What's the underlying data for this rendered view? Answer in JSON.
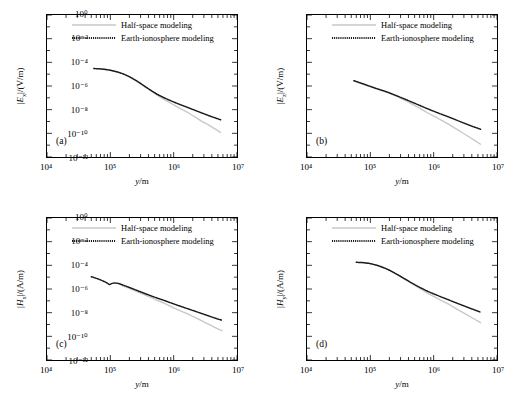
{
  "figure": {
    "panels": [
      "a",
      "b",
      "c",
      "d"
    ]
  },
  "axes": {
    "xlabel": "y/m",
    "xticks": [
      "10⁴",
      "10⁵",
      "10⁶",
      "10⁷"
    ],
    "xlim": [
      10000,
      10000000
    ],
    "yticks": [
      "10⁰",
      "10⁻²",
      "10⁻⁴",
      "10⁻⁶",
      "10⁻⁸",
      "10⁻¹⁰",
      "10⁻¹²"
    ],
    "ylim": [
      1e-12,
      1
    ],
    "grid": false,
    "xscale": "log",
    "yscale": "log"
  },
  "legend": {
    "position": "upper-center",
    "entries": [
      {
        "label": "Half-space modeling",
        "style": "solid",
        "color": "#c8c8c8"
      },
      {
        "label": "Earth-ionosphere modeling",
        "style": "dotted",
        "color": "#1a1a1a"
      }
    ]
  },
  "chart_data": [
    {
      "type": "line",
      "panel": "(a)",
      "title": "",
      "xlabel": "y/m",
      "ylabel": "|Eₓ|/(V/m)",
      "ylabel_base": "E",
      "ylabel_sub": "x",
      "ylabel_unit": "(V/m)",
      "xlim": [
        10000,
        10000000
      ],
      "ylim": [
        1e-12,
        1
      ],
      "series": [
        {
          "name": "Half-space modeling",
          "style": "solid",
          "color": "#c8c8c8",
          "x": [
            55000,
            80000,
            120000,
            180000,
            260000,
            380000,
            550000,
            800000,
            1200000,
            1800000,
            2600000,
            3800000,
            5500000
          ],
          "y": [
            3e-05,
            2.6e-05,
            1.7e-05,
            8e-06,
            2.6e-06,
            6.5e-07,
            1.7e-07,
            5e-08,
            1.5e-08,
            4.5e-09,
            1.3e-09,
            4e-10,
            1.2e-10
          ]
        },
        {
          "name": "Earth-ionosphere modeling",
          "style": "dotted",
          "color": "#1a1a1a",
          "x": [
            55000,
            80000,
            120000,
            180000,
            260000,
            380000,
            550000,
            800000,
            1200000,
            1800000,
            2600000,
            3800000,
            5500000
          ],
          "y": [
            3e-05,
            2.6e-05,
            1.7e-05,
            8e-06,
            2.7e-06,
            7e-07,
            2e-07,
            7.5e-08,
            3e-08,
            1.3e-08,
            6e-09,
            2.8e-09,
            1.4e-09
          ]
        }
      ]
    },
    {
      "type": "line",
      "panel": "(b)",
      "title": "",
      "xlabel": "y/m",
      "ylabel": "|Eᵣ|/(V/m)",
      "ylabel_base": "E",
      "ylabel_sub": "z",
      "ylabel_unit": "(V/m)",
      "xlim": [
        10000,
        10000000
      ],
      "ylim": [
        1e-12,
        1
      ],
      "series": [
        {
          "name": "Half-space modeling",
          "style": "solid",
          "color": "#c8c8c8",
          "x": [
            55000,
            80000,
            120000,
            180000,
            260000,
            380000,
            550000,
            800000,
            1200000,
            1800000,
            2600000,
            3800000,
            5500000
          ],
          "y": [
            2.8e-06,
            1.4e-06,
            6.5e-07,
            3e-07,
            1.3e-07,
            5e-08,
            1.7e-08,
            5.5e-09,
            1.7e-09,
            5e-10,
            1.5e-10,
            4.2e-11,
            1.2e-11
          ]
        },
        {
          "name": "Earth-ionosphere modeling",
          "style": "dotted",
          "color": "#1a1a1a",
          "x": [
            55000,
            80000,
            120000,
            180000,
            260000,
            380000,
            550000,
            800000,
            1200000,
            1800000,
            2600000,
            3800000,
            5500000
          ],
          "y": [
            2.8e-06,
            1.4e-06,
            6.5e-07,
            3.2e-07,
            1.5e-07,
            6.5e-08,
            2.8e-08,
            1.2e-08,
            5e-09,
            2.2e-09,
            1e-09,
            4.5e-10,
            2.2e-10
          ]
        }
      ]
    },
    {
      "type": "line",
      "panel": "(c)",
      "title": "",
      "xlabel": "y/m",
      "ylabel": "|Hₓ|/(A/m)",
      "ylabel_base": "H",
      "ylabel_sub": "x",
      "ylabel_unit": "(A/m)",
      "xlim": [
        10000,
        10000000
      ],
      "ylim": [
        1e-12,
        1
      ],
      "series": [
        {
          "name": "Half-space modeling",
          "style": "solid",
          "color": "#c8c8c8",
          "x": [
            150000,
            220000,
            320000,
            470000,
            700000,
            1000000,
            1500000,
            2200000,
            3200000,
            4700000,
            5800000
          ],
          "y": [
            2e-06,
            9e-07,
            3.8e-07,
            1.6e-07,
            6.5e-08,
            2.6e-08,
            1e-08,
            3.8e-09,
            1.4e-09,
            5e-10,
            3e-10
          ]
        },
        {
          "name": "Earth-ionosphere modeling",
          "style": "dotted",
          "color": "#1a1a1a",
          "x": [
            50000,
            62000,
            75000,
            88000,
            97000,
            105000,
            115000,
            130000,
            150000,
            220000,
            320000,
            470000,
            700000,
            1000000,
            1500000,
            2200000,
            3200000,
            4700000,
            5800000
          ],
          "y": [
            1.1e-05,
            7.5e-06,
            5e-06,
            3.3e-06,
            2.4e-06,
            2.9e-06,
            3.2e-06,
            3e-06,
            2.4e-06,
            1.1e-06,
            5e-07,
            2.3e-07,
            1.1e-07,
            5.5e-08,
            2.6e-08,
            1.3e-08,
            6.5e-09,
            3.2e-09,
            2.3e-09
          ]
        }
      ]
    },
    {
      "type": "line",
      "panel": "(d)",
      "title": "",
      "xlabel": "y/m",
      "ylabel": "|Hᵧ|/(A/m)",
      "ylabel_base": "H",
      "ylabel_sub": "y",
      "ylabel_unit": "(A/m)",
      "xlim": [
        10000,
        10000000
      ],
      "ylim": [
        1e-12,
        1
      ],
      "series": [
        {
          "name": "Half-space modeling",
          "style": "solid",
          "color": "#c8c8c8",
          "x": [
            60000,
            85000,
            120000,
            180000,
            260000,
            380000,
            550000,
            800000,
            1200000,
            1800000,
            2600000,
            3800000,
            5500000
          ],
          "y": [
            0.00018,
            0.00016,
            0.00011,
            5e-05,
            1.7e-05,
            5e-06,
            1.5e-06,
            4.5e-07,
            1.4e-07,
            4.5e-08,
            1.4e-08,
            4.5e-09,
            1.4e-09
          ]
        },
        {
          "name": "Earth-ionosphere modeling",
          "style": "dotted",
          "color": "#1a1a1a",
          "x": [
            60000,
            85000,
            120000,
            180000,
            260000,
            380000,
            550000,
            800000,
            1200000,
            1800000,
            2600000,
            3800000,
            5500000
          ],
          "y": [
            0.00018,
            0.00016,
            0.00011,
            5e-05,
            1.8e-05,
            5.5e-06,
            1.8e-06,
            6.5e-07,
            2.6e-07,
            1.1e-07,
            5e-08,
            2.3e-08,
            1.1e-08
          ]
        }
      ]
    }
  ]
}
